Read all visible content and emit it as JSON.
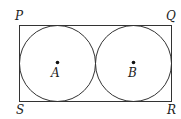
{
  "diagram": {
    "vertices": {
      "top_left": "P",
      "top_right": "Q",
      "bottom_left": "S",
      "bottom_right": "R"
    },
    "centers": {
      "left": "A",
      "right": "B"
    },
    "colors": {
      "stroke": "#333333",
      "background": "#ffffff"
    }
  }
}
